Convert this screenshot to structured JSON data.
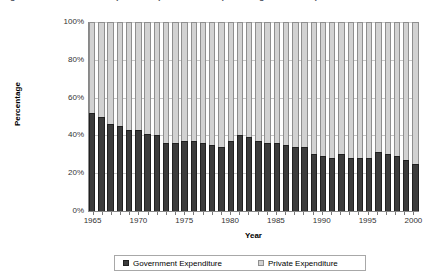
{
  "chart_data": {
    "type": "bar",
    "stacked": true,
    "stack_mode": "percent",
    "title": "Figure 1. Government and private expenditure as a percentage of total expenditure",
    "xlabel": "Year",
    "ylabel": "Percentage",
    "ylim": [
      0,
      100
    ],
    "ytick_labels": [
      "0%",
      "20%",
      "40%",
      "60%",
      "80%",
      "100%"
    ],
    "ytick_values": [
      0,
      20,
      40,
      60,
      80,
      100
    ],
    "grid": true,
    "grid_axis": "y",
    "legend_position": "bottom",
    "categories": [
      "1965",
      "1966",
      "1967",
      "1968",
      "1969",
      "1970",
      "1971",
      "1972",
      "1973",
      "1974",
      "1975",
      "1976",
      "1977",
      "1978",
      "1979",
      "1980",
      "1981",
      "1982",
      "1983",
      "1984",
      "1985",
      "1986",
      "1987",
      "1988",
      "1989",
      "1990",
      "1991",
      "1992",
      "1993",
      "1994",
      "1995",
      "1996",
      "1997",
      "1998",
      "1999",
      "2000"
    ],
    "xtick_labels": [
      "1965",
      "1970",
      "1975",
      "1980",
      "1985",
      "1990",
      "1995",
      "2000"
    ],
    "series": [
      {
        "name": "Government Expenditure",
        "color": "#3c3c3c",
        "values": [
          52,
          50,
          46,
          45,
          43,
          43,
          41,
          40,
          36,
          36,
          37,
          37,
          36,
          35,
          34,
          37,
          40,
          39,
          37,
          36,
          36,
          35,
          34,
          34,
          30,
          29,
          28,
          30,
          28,
          28,
          28,
          31,
          30,
          29,
          27,
          25
        ]
      },
      {
        "name": "Private Expenditure",
        "color": "#d2d2d2",
        "values": [
          48,
          50,
          54,
          55,
          57,
          57,
          59,
          60,
          64,
          64,
          63,
          63,
          64,
          65,
          66,
          63,
          60,
          61,
          63,
          64,
          64,
          65,
          66,
          66,
          70,
          71,
          72,
          70,
          72,
          72,
          72,
          69,
          70,
          71,
          73,
          75
        ]
      }
    ]
  },
  "legend": {
    "items": [
      {
        "label": "Government Expenditure",
        "swatch": "gov"
      },
      {
        "label": "Private Expenditure",
        "swatch": "priv"
      }
    ]
  }
}
